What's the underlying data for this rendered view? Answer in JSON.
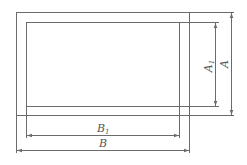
{
  "diagram": {
    "type": "dimensioned-rectangle-frame",
    "outer_rect": {
      "x": 16,
      "y": 12,
      "width": 173,
      "height": 103
    },
    "inner_rect": {
      "x": 26,
      "y": 22,
      "width": 153,
      "height": 84
    },
    "colors": {
      "line": "#6b6b6b",
      "text": "#555555"
    },
    "dimensions": {
      "A": {
        "label": "A",
        "subscript": "",
        "orientation": "vertical"
      },
      "A1": {
        "label": "A",
        "subscript": "1",
        "orientation": "vertical"
      },
      "B": {
        "label": "B",
        "subscript": "",
        "orientation": "horizontal"
      },
      "B1": {
        "label": "B",
        "subscript": "1",
        "orientation": "horizontal"
      }
    }
  }
}
